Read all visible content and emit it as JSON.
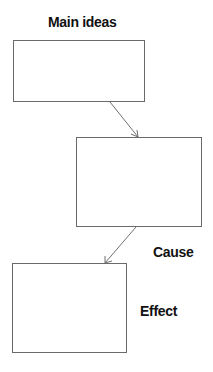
{
  "diagram": {
    "labels": {
      "main_ideas": "Main ideas",
      "cause": "Cause",
      "effect": "Effect"
    },
    "boxes": [
      {
        "id": "main-ideas-box",
        "x": 13,
        "y": 40,
        "w": 132,
        "h": 62,
        "text": ""
      },
      {
        "id": "cause-box",
        "x": 76,
        "y": 137,
        "w": 126,
        "h": 90,
        "text": ""
      },
      {
        "id": "effect-box",
        "x": 12,
        "y": 263,
        "w": 115,
        "h": 90,
        "text": ""
      }
    ],
    "arrows": [
      {
        "from": "main-ideas-box",
        "to": "cause-box"
      },
      {
        "from": "cause-box",
        "to": "effect-box"
      }
    ],
    "colors": {
      "line": "#6a6a6a",
      "text": "#111111"
    }
  }
}
